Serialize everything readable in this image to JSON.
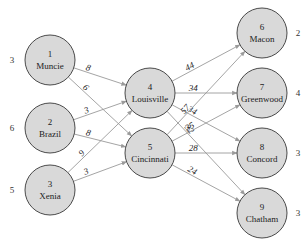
{
  "diagram": {
    "type": "transshipment-network",
    "nodes": [
      {
        "id": "1",
        "name": "Muncie",
        "x": 50,
        "y": 60,
        "side_value": "3",
        "side": "left"
      },
      {
        "id": "2",
        "name": "Brazil",
        "x": 50,
        "y": 128,
        "side_value": "6",
        "side": "left"
      },
      {
        "id": "3",
        "name": "Xenia",
        "x": 50,
        "y": 190,
        "side_value": "5",
        "side": "left"
      },
      {
        "id": "4",
        "name": "Louisville",
        "x": 150,
        "y": 93,
        "side_value": "",
        "side": "none"
      },
      {
        "id": "5",
        "name": "Cincinnati",
        "x": 150,
        "y": 153,
        "side_value": "",
        "side": "none"
      },
      {
        "id": "6",
        "name": "Macon",
        "x": 262,
        "y": 33,
        "side_value": "2",
        "side": "right"
      },
      {
        "id": "7",
        "name": "Greenwood",
        "x": 262,
        "y": 93,
        "side_value": "4",
        "side": "right"
      },
      {
        "id": "8",
        "name": "Concord",
        "x": 262,
        "y": 153,
        "side_value": "3",
        "side": "right"
      },
      {
        "id": "9",
        "name": "Chatham",
        "x": 262,
        "y": 213,
        "side_value": "3",
        "side": "right"
      }
    ],
    "edges": [
      {
        "from": "1",
        "to": "4",
        "label": "8"
      },
      {
        "from": "1",
        "to": "5",
        "label": "6"
      },
      {
        "from": "2",
        "to": "4",
        "label": "3"
      },
      {
        "from": "2",
        "to": "5",
        "label": "8"
      },
      {
        "from": "3",
        "to": "4",
        "label": "9"
      },
      {
        "from": "3",
        "to": "5",
        "label": "3"
      },
      {
        "from": "4",
        "to": "6",
        "label": "44"
      },
      {
        "from": "4",
        "to": "7",
        "label": "34"
      },
      {
        "from": "4",
        "to": "8",
        "label": "34"
      },
      {
        "from": "4",
        "to": "9",
        "label": "32"
      },
      {
        "from": "5",
        "to": "6",
        "label": "57"
      },
      {
        "from": "5",
        "to": "7",
        "label": "35"
      },
      {
        "from": "5",
        "to": "8",
        "label": "28"
      },
      {
        "from": "5",
        "to": "9",
        "label": "24"
      }
    ],
    "colors": {
      "node_fill": "#d9d9d9",
      "node_stroke": "#4a4a4a",
      "edge": "#9a9a9a",
      "text": "#222222"
    }
  }
}
